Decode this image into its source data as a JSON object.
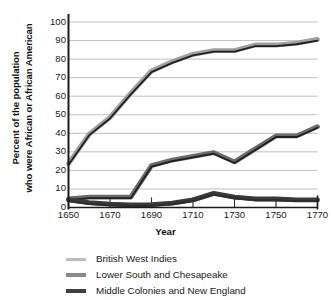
{
  "chart_data": {
    "type": "line",
    "title": "",
    "xlabel": "Year",
    "ylabel": "Percent of the population who were African or African American",
    "ylabel_line1": "Percent of the population",
    "ylabel_line2": "who were African or African American",
    "x": [
      1650,
      1660,
      1670,
      1680,
      1690,
      1700,
      1710,
      1720,
      1730,
      1740,
      1750,
      1760,
      1770
    ],
    "xlim": [
      1650,
      1770
    ],
    "ylim": [
      0,
      100
    ],
    "xticks": [
      1650,
      1670,
      1690,
      1710,
      1730,
      1750,
      1770
    ],
    "xtick_labels": [
      "1650",
      "1670",
      "1690",
      "1710",
      "1730",
      "1750",
      "1770"
    ],
    "yticks": [
      0,
      10,
      20,
      30,
      40,
      50,
      60,
      70,
      80,
      90,
      100
    ],
    "ytick_labels": [
      "0",
      "10",
      "20",
      "30",
      "40",
      "50",
      "60",
      "70",
      "80",
      "90",
      "100"
    ],
    "grid": "horizontal",
    "legend_position": "below",
    "series": [
      {
        "name": "British West Indies",
        "color": "#9f9f9f",
        "line_width": 3.2,
        "values": [
          23,
          39,
          48,
          61,
          73,
          78,
          82,
          84,
          84,
          87,
          87,
          88,
          90
        ]
      },
      {
        "name": "Lower South and Chesapeake",
        "color": "#6b6b6b",
        "line_width": 3.2,
        "values": [
          4,
          5,
          5,
          5,
          22,
          25,
          27,
          29,
          24,
          31,
          38,
          38,
          43
        ]
      },
      {
        "name": "Middle Colonies and New England",
        "color": "#3a3a3a",
        "line_width": 3.2,
        "values": [
          3.5,
          2,
          1.2,
          0.8,
          1,
          1.8,
          3.5,
          7,
          5,
          4,
          4,
          3.5,
          3.5
        ]
      }
    ]
  },
  "legend": {
    "items": [
      {
        "label": "British West Indies",
        "color": "#bcbcbc",
        "thickness": 3
      },
      {
        "label": "Lower South and Chesapeake",
        "color": "#8a8a8a",
        "thickness": 3.5
      },
      {
        "label": "Middle Colonies and New England",
        "color": "#3f3f3f",
        "thickness": 4
      }
    ]
  },
  "axes": {
    "x_title": "Year",
    "y_title_line1": "Percent of the population",
    "y_title_line2": "who were African or African American"
  }
}
